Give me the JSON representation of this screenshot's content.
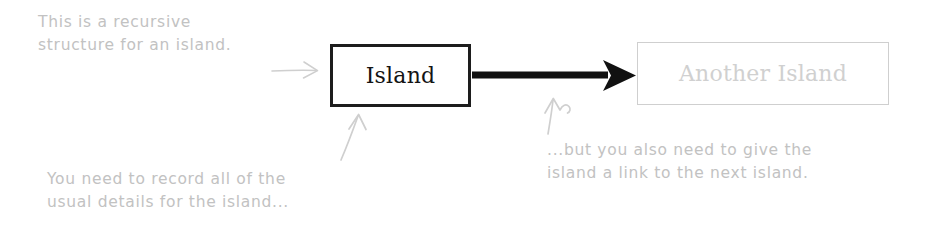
{
  "diagram": {
    "background_color": "#ffffff",
    "nodes": [
      {
        "id": "island",
        "label": "Island",
        "style": "solid",
        "border_color": "#1d1d1d",
        "text_color": "#141414"
      },
      {
        "id": "another-island",
        "label": "Another Island",
        "style": "faint",
        "border_color": "#cfcfcf",
        "text_color": "#d0d0d0"
      }
    ],
    "edges": [
      {
        "id": "island-to-another-island",
        "from": "island",
        "to": "another-island",
        "style": "solid-thick-arrow",
        "color": "#111111"
      }
    ],
    "annotations": [
      {
        "id": "note-top-left",
        "lines": [
          "This is a recursive",
          "structure for an island."
        ],
        "color": "#c2c2c2",
        "pointer": "arrow-right-to-island"
      },
      {
        "id": "note-bottom-left",
        "lines": [
          "You need to record all of the",
          "usual details for the island..."
        ],
        "color": "#c2c2c2",
        "pointer": "arrow-up-to-island"
      },
      {
        "id": "note-bottom-right",
        "lines": [
          "...but you also need to give the",
          "island a link to the next island."
        ],
        "color": "#c2c2c2",
        "pointer": "arrow-up-to-link"
      }
    ]
  }
}
